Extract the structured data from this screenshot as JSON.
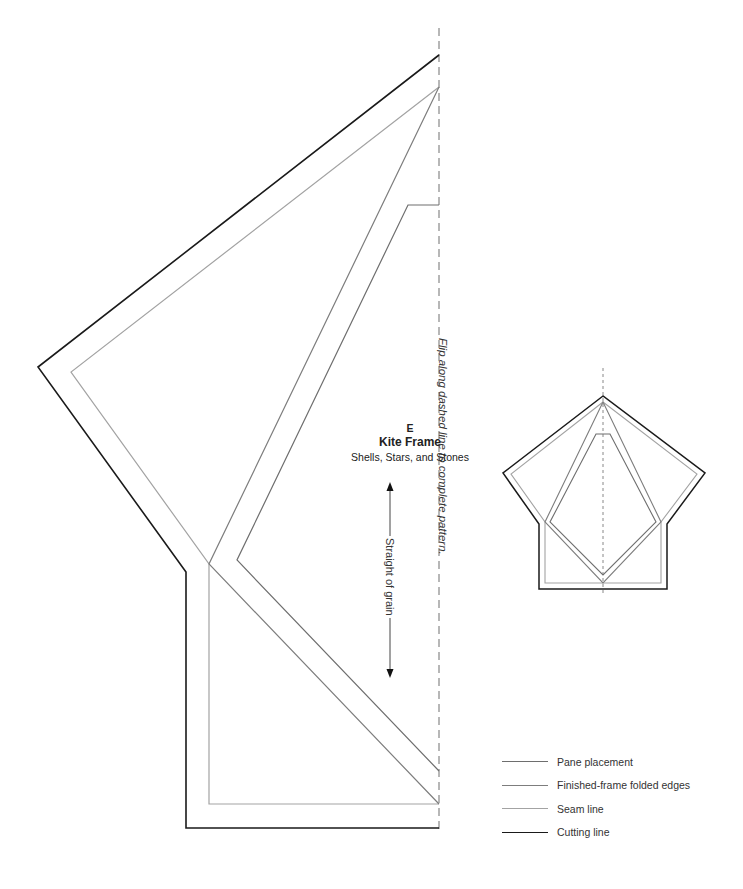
{
  "pattern": {
    "letter": "E",
    "title": "Kite Frame",
    "subtitle": "Shells, Stars, and Stones",
    "flip_instruction": "Flip along dashed line to complete pattern.",
    "grain_label": "Straight of grain"
  },
  "legend": {
    "items": [
      {
        "label": "Pane placement",
        "color": "#6e6e6e",
        "line": "pane"
      },
      {
        "label": "Finished-frame folded edges",
        "color": "#7d7d7d",
        "line": "fold"
      },
      {
        "label": "Seam line",
        "color": "#a3a3a3",
        "line": "seam"
      },
      {
        "label": "Cutting line",
        "color": "#1a1a1a",
        "line": "cut"
      }
    ]
  },
  "colors": {
    "cut": "#1a1a1a",
    "seam": "#a3a3a3",
    "fold": "#7d7d7d",
    "pane": "#6e6e6e",
    "dashed": "#888888"
  }
}
